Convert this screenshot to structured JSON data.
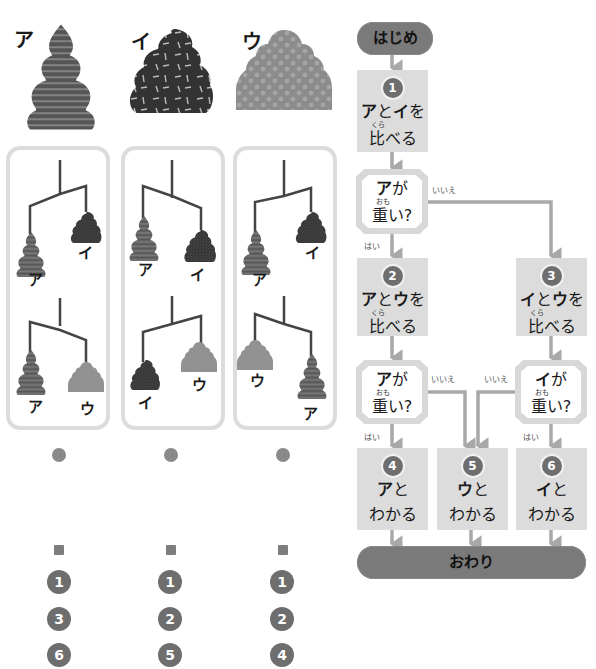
{
  "weights": {
    "a": {
      "label": "ア",
      "pattern": "stripes",
      "color": "#555555"
    },
    "i": {
      "label": "イ",
      "pattern": "sprinkles",
      "color": "#333333"
    },
    "u": {
      "label": "ウ",
      "pattern": "polka-dots",
      "color": "#8c8c8c"
    }
  },
  "panels": [
    {
      "top_scale": {
        "left": "ア",
        "right": "イ",
        "heavier": "ア"
      },
      "bottom_scale": {
        "left": "ア",
        "right": "ウ",
        "heavier": "ア"
      },
      "answer_steps": [
        "1",
        "3",
        "6"
      ]
    },
    {
      "top_scale": {
        "left": "ア",
        "right": "イ",
        "heavier": "イ"
      },
      "bottom_scale": {
        "left": "イ",
        "right": "ウ",
        "heavier": "イ"
      },
      "answer_steps": [
        "1",
        "2",
        "5"
      ]
    },
    {
      "top_scale": {
        "left": "ア",
        "right": "イ",
        "heavier": "ア"
      },
      "bottom_scale": {
        "left": "ウ",
        "right": "ア",
        "heavier": "ア"
      },
      "answer_steps": [
        "1",
        "2",
        "4"
      ]
    }
  ],
  "flowchart": {
    "start": "はじめ",
    "end": "おわり",
    "step1": {
      "num": "1",
      "line1_bold1": "ア",
      "line1_mid": "と",
      "line1_bold2": "イ",
      "line1_end": "を",
      "ruby": "くら",
      "line2": "比べる"
    },
    "decision1": {
      "bold": "ア",
      "rest": "が",
      "ruby": "おも",
      "line2": "重い?",
      "yes": "はい",
      "no": "いいえ"
    },
    "step2": {
      "num": "2",
      "line1_bold1": "ア",
      "line1_mid": "と",
      "line1_bold2": "ウ",
      "line1_end": "を",
      "ruby": "くら",
      "line2": "比べる"
    },
    "step3": {
      "num": "3",
      "line1_bold1": "イ",
      "line1_mid": "と",
      "line1_bold2": "ウ",
      "line1_end": "を",
      "ruby": "くら",
      "line2": "比べる"
    },
    "decision2": {
      "bold": "ア",
      "rest": "が",
      "ruby": "おも",
      "line2": "重い?",
      "yes": "はい",
      "no": "いいえ"
    },
    "decision3": {
      "bold": "イ",
      "rest": "が",
      "ruby": "おも",
      "line2": "重い?",
      "yes": "はい",
      "no": "いいえ"
    },
    "step4": {
      "num": "4",
      "bold": "ア",
      "rest": "と",
      "line2": "わかる"
    },
    "step5": {
      "num": "5",
      "bold": "ウ",
      "rest": "と",
      "line2": "わかる"
    },
    "step6": {
      "num": "6",
      "bold": "イ",
      "rest": "と",
      "line2": "わかる"
    }
  },
  "colors": {
    "panel_border": "#dcdcdc",
    "box_fill": "#dcdcdc",
    "pill_fill": "#7a7a7a",
    "arrow": "#a8a8a8",
    "badge": "#6e6e6e"
  }
}
